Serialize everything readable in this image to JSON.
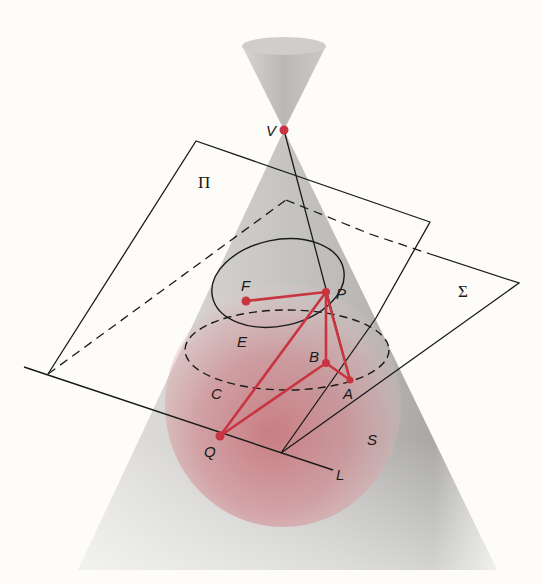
{
  "figure": {
    "colors": {
      "background": "#fdfcf8",
      "cone_gray": "#b9b9b6",
      "sphere_red": "#c4545c",
      "red_lines": "#c8343f",
      "ink": "#1a1a1a"
    }
  },
  "labels": {
    "V": "V",
    "Pi": "Π",
    "Sigma": "Σ",
    "F": "F",
    "P": "P",
    "E": "E",
    "B": "B",
    "A": "A",
    "C": "C",
    "Q": "Q",
    "S": "S",
    "L": "L"
  },
  "points": {
    "V": [
      284,
      130
    ],
    "F": [
      246,
      301
    ],
    "P": [
      326,
      292
    ],
    "B": [
      326,
      363
    ],
    "A": [
      350,
      380
    ],
    "Q": [
      220,
      436
    ]
  }
}
